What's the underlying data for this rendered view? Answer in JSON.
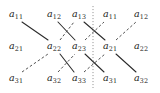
{
  "figure": {
    "width": 160,
    "height": 93,
    "background": "#ffffff",
    "text_color": "#1b1b1b",
    "solid_color": "#2a2a2a",
    "dashed_color": "#4a4a4a",
    "dotted_color": "#8a8a8a"
  },
  "grid": {
    "column_x": [
      16,
      54,
      79,
      110,
      141
    ],
    "row_y": [
      15,
      47,
      79
    ],
    "rows": [
      [
        {
          "base": "a",
          "sub": "11"
        },
        {
          "base": "a",
          "sub": "12"
        },
        {
          "base": "a",
          "sub": "13"
        },
        {
          "base": "a",
          "sub": "11"
        },
        {
          "base": "a",
          "sub": "12"
        }
      ],
      [
        {
          "base": "a",
          "sub": "21"
        },
        {
          "base": "a",
          "sub": "22"
        },
        {
          "base": "a",
          "sub": "23"
        },
        {
          "base": "a",
          "sub": "21"
        },
        {
          "base": "a",
          "sub": "22"
        }
      ],
      [
        {
          "base": "a",
          "sub": "31"
        },
        {
          "base": "a",
          "sub": "32"
        },
        {
          "base": "a",
          "sub": "33"
        },
        {
          "base": "a",
          "sub": "31"
        },
        {
          "base": "a",
          "sub": "32"
        }
      ]
    ]
  },
  "labels": {
    "r0c0": "a",
    "r0c0s": "11",
    "r0c1": "a",
    "r0c1s": "12",
    "r0c2": "a",
    "r0c2s": "13",
    "r0c3": "a",
    "r0c3s": "11",
    "r0c4": "a",
    "r0c4s": "12",
    "r1c0": "a",
    "r1c0s": "21",
    "r1c1": "a",
    "r1c1s": "22",
    "r1c2": "a",
    "r1c2s": "23",
    "r1c3": "a",
    "r1c3s": "21",
    "r1c4": "a",
    "r1c4s": "22",
    "r2c0": "a",
    "r2c0s": "31",
    "r2c1": "a",
    "r2c1s": "32",
    "r2c2": "a",
    "r2c2s": "33",
    "r2c3": "a",
    "r2c3s": "31",
    "r2c4": "a",
    "r2c4s": "32"
  },
  "diagonals": {
    "solid": [
      {
        "name": "solid-a11-a22",
        "x1": 22,
        "y1": 22,
        "x2": 48,
        "y2": 40
      },
      {
        "name": "solid-a22-a33",
        "x1": 60,
        "y1": 54,
        "x2": 74,
        "y2": 72
      },
      {
        "name": "solid-a12-a23",
        "x1": 58,
        "y1": 22,
        "x2": 75,
        "y2": 40
      },
      {
        "name": "solid-a23-a31dup",
        "x1": 85,
        "y1": 54,
        "x2": 104,
        "y2": 72
      },
      {
        "name": "solid-a13-a21dup",
        "x1": 84,
        "y1": 22,
        "x2": 105,
        "y2": 40
      },
      {
        "name": "solid-a21dup-a32dup",
        "x1": 116,
        "y1": 54,
        "x2": 136,
        "y2": 72
      }
    ],
    "dashed": [
      {
        "name": "dashed-a31-a22",
        "x1": 22,
        "y1": 72,
        "x2": 48,
        "y2": 54
      },
      {
        "name": "dashed-a22-a13",
        "x1": 60,
        "y1": 40,
        "x2": 74,
        "y2": 22
      },
      {
        "name": "dashed-a32-a23",
        "x1": 58,
        "y1": 72,
        "x2": 75,
        "y2": 54
      },
      {
        "name": "dashed-a23-a11dup",
        "x1": 85,
        "y1": 40,
        "x2": 104,
        "y2": 22
      },
      {
        "name": "dashed-a33-a21dup",
        "x1": 84,
        "y1": 72,
        "x2": 105,
        "y2": 54
      },
      {
        "name": "dashed-a21dup-a12dup",
        "x1": 116,
        "y1": 40,
        "x2": 136,
        "y2": 22
      }
    ],
    "separator": {
      "name": "vertical-dotted-separator",
      "x": 93,
      "y1": 6,
      "y2": 88
    }
  }
}
